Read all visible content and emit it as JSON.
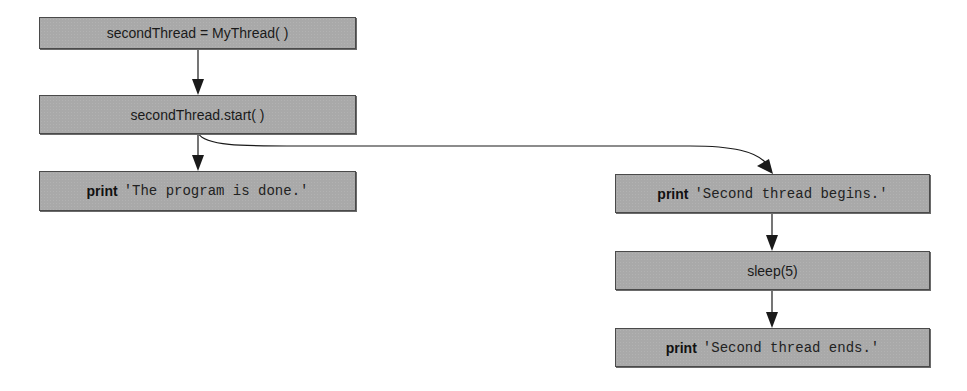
{
  "diagram": {
    "nodes": [
      {
        "id": "n1",
        "text": "secondThread = MyThread( )"
      },
      {
        "id": "n2",
        "text": "secondThread.start( )"
      },
      {
        "id": "n3",
        "keyword": "print",
        "string": "'The program is done.'"
      },
      {
        "id": "n4",
        "keyword": "print",
        "string": "'Second thread begins.'"
      },
      {
        "id": "n5",
        "text": "sleep(5)"
      },
      {
        "id": "n6",
        "keyword": "print",
        "string": "'Second thread ends.'"
      }
    ],
    "edges": [
      {
        "from": "n1",
        "to": "n2",
        "style": "straight"
      },
      {
        "from": "n2",
        "to": "n3",
        "style": "straight"
      },
      {
        "from": "n2",
        "to": "n4",
        "style": "curved"
      },
      {
        "from": "n4",
        "to": "n5",
        "style": "straight"
      },
      {
        "from": "n5",
        "to": "n6",
        "style": "straight"
      }
    ],
    "colors": {
      "box_fill": "#a9a9a9",
      "box_border": "#4a4a4a",
      "arrow": "#1a1a1a"
    }
  }
}
